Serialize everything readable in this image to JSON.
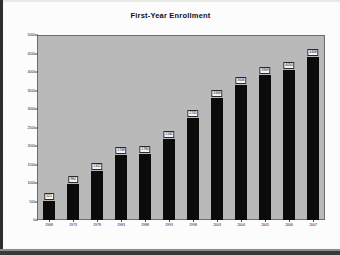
{
  "chart_data": {
    "type": "bar",
    "title": "First-Year Enrollment",
    "xlabel": "",
    "ylabel": "",
    "categories": [
      "1968",
      "1973",
      "1978",
      "1983",
      "1988",
      "1993",
      "1998",
      "2003",
      "2004",
      "2005",
      "2006",
      "2007"
    ],
    "values": [
      521,
      984,
      1322,
      1748,
      1780,
      2182,
      2745,
      3308,
      3646,
      3909,
      4050,
      4408
    ],
    "ylim": [
      0,
      5000
    ],
    "yticks": [
      0,
      500,
      1000,
      1500,
      2000,
      2500,
      3000,
      3500,
      4000,
      4500,
      5000
    ],
    "ytick_labels": [
      "0",
      "500",
      "1000",
      "1500",
      "2000",
      "2500",
      "3000",
      "3500",
      "4000",
      "4500",
      "5000"
    ],
    "grid": false,
    "legend": null,
    "bar_color": "#0b0b0b",
    "plot_background": "#b9b9b9",
    "data_labels_shown": true
  }
}
